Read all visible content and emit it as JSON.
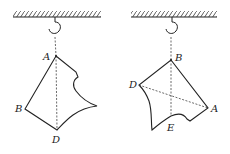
{
  "figures": [
    {
      "name": "left-suspension",
      "suspended_at": "A",
      "labels": [
        {
          "text": "A",
          "x": 43,
          "y": 60
        },
        {
          "text": "B",
          "x": 15,
          "y": 112
        },
        {
          "text": "D",
          "x": 52,
          "y": 143
        }
      ]
    },
    {
      "name": "right-suspension",
      "suspended_at": "B",
      "labels": [
        {
          "text": "B",
          "x": 175,
          "y": 61
        },
        {
          "text": "D",
          "x": 129,
          "y": 88
        },
        {
          "text": "A",
          "x": 211,
          "y": 112
        },
        {
          "text": "E",
          "x": 167,
          "y": 131
        }
      ]
    }
  ],
  "colors": {
    "line": "#222222",
    "background": "#ffffff"
  }
}
